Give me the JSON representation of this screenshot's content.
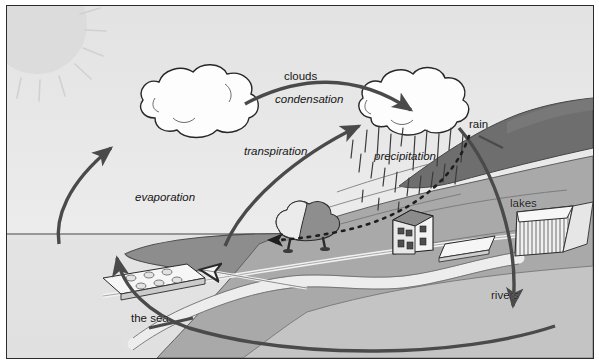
{
  "figure": {
    "type": "diagram",
    "frame": {
      "border_color": "#2b2b2b",
      "background": "#e9e9e9"
    }
  },
  "palette": {
    "sky": "#e6e6e6",
    "sea": "#e2e2e2",
    "sea_bay_dark": "#8d8d8d",
    "land_mid": "#a9a9a9",
    "land_light": "#c4c4c4",
    "hill_dark": "#6e6e6e",
    "cloud_white": "#fdfdfd",
    "outline": "#2a2a2a",
    "arrow": "#4a4a4a",
    "sun": "#dcdcdc",
    "river_white": "#ededed",
    "text": "#161616"
  },
  "labels": [
    {
      "id": "clouds",
      "text": "clouds",
      "style": "upright",
      "x": 283,
      "y": 72,
      "size": 11.5
    },
    {
      "id": "condensation",
      "text": "condensation",
      "style": "italic",
      "x": 274,
      "y": 95,
      "size": 11.5
    },
    {
      "id": "transpiration",
      "text": "transpiration",
      "style": "italic",
      "x": 243,
      "y": 146,
      "size": 11.5
    },
    {
      "id": "precipitation",
      "text": "precipitation",
      "style": "italic",
      "x": 373,
      "y": 151,
      "size": 11.5
    },
    {
      "id": "rain",
      "text": "rain",
      "style": "upright",
      "x": 468,
      "y": 119,
      "size": 11.5
    },
    {
      "id": "evaporation",
      "text": "evaporation",
      "style": "italic",
      "x": 134,
      "y": 192,
      "size": 11.5
    },
    {
      "id": "lakes",
      "text": "lakes",
      "style": "upright",
      "x": 509,
      "y": 198,
      "size": 11.5
    },
    {
      "id": "rivers",
      "text": "rivers",
      "style": "upright",
      "x": 490,
      "y": 290,
      "size": 11.5
    },
    {
      "id": "the-sea",
      "text": "the sea",
      "style": "upright",
      "x": 130,
      "y": 313,
      "size": 11.5
    }
  ],
  "elements": {
    "sun": {
      "name": "sun",
      "note": "pale disc with radiating rays, top-left corner"
    },
    "cloud_left": {
      "name": "evaporation-cloud",
      "note": "white puffy cloud upper-left-centre"
    },
    "cloud_right": {
      "name": "rain-cloud",
      "note": "white puffy cloud upper-right with rain streaks"
    },
    "sea": {
      "name": "sea",
      "note": "light horizon sea at left, dark bay inlet"
    },
    "land": {
      "name": "landmass",
      "note": "hills and valley at right"
    },
    "lake": {
      "name": "lake-reservoir",
      "note": "hatched white trapezoid reservoir"
    },
    "river": {
      "name": "river",
      "note": "winding pale river flowing to the sea"
    },
    "tree": {
      "name": "tree",
      "note": "two-tone tree in valley, transpiration source"
    },
    "house": {
      "name": "house",
      "note": "small house with windows beside the road"
    },
    "field_front": {
      "name": "field-plot",
      "note": "white dotted field parcel near road"
    },
    "field_back": {
      "name": "field-plot",
      "note": "white field parcel on far bank"
    },
    "road": {
      "name": "road",
      "note": "white road running across the valley"
    }
  },
  "arrows": [
    {
      "id": "evaporation-arrow",
      "from": "sea",
      "to": "cloud-left",
      "style": "solid"
    },
    {
      "id": "condensation-arrow",
      "from": "cloud-left",
      "to": "cloud-right",
      "style": "solid"
    },
    {
      "id": "transpiration-arrow",
      "from": "tree",
      "to": "cloud-right",
      "style": "solid"
    },
    {
      "id": "rain-runoff-arrow",
      "from": "rain-cloud",
      "to": "valley",
      "style": "solid"
    },
    {
      "id": "groundwater-arrow",
      "from": "house",
      "to": "tree",
      "style": "dotted"
    },
    {
      "id": "outflow-arrow",
      "from": "valley",
      "to": "sea",
      "style": "solid-open"
    },
    {
      "id": "return-to-sea-arrow",
      "from": "land",
      "to": "sea",
      "style": "solid"
    }
  ]
}
